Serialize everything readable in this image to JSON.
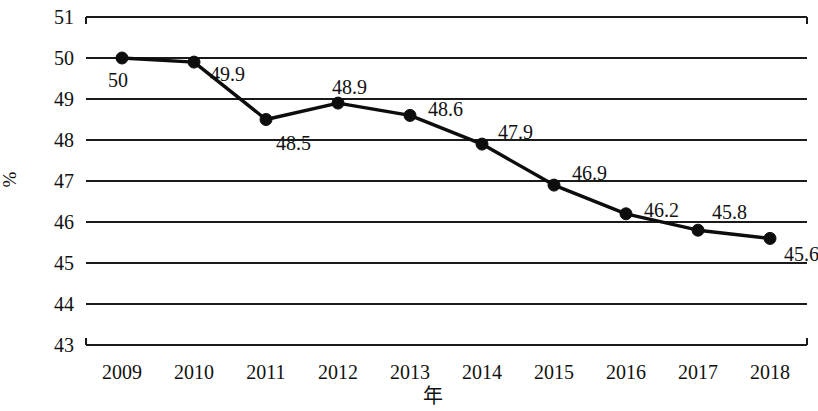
{
  "chart_data": {
    "type": "line",
    "title": "",
    "subtitle": "",
    "xlabel": "年",
    "ylabel": "%",
    "categories": [
      "2009",
      "2010",
      "2011",
      "2012",
      "2013",
      "2014",
      "2015",
      "2016",
      "2017",
      "2018"
    ],
    "values": [
      50,
      49.9,
      48.5,
      48.9,
      48.6,
      47.9,
      46.9,
      46.2,
      45.8,
      45.6
    ],
    "point_labels": [
      "50",
      "49.9",
      "48.5",
      "48.9",
      "48.6",
      "47.9",
      "46.9",
      "46.2",
      "45.8",
      "45.6"
    ],
    "ylim": [
      43,
      51
    ],
    "ytick_labels": [
      "51",
      "50",
      "49",
      "48",
      "47",
      "46",
      "45",
      "44",
      "43"
    ],
    "ytick_values": [
      51,
      50,
      49,
      48,
      47,
      46,
      45,
      44,
      43
    ],
    "grid": true,
    "grid_orientation": "horizontal",
    "legend": null,
    "legend_position": "none",
    "marker": "filled-circle",
    "line_color": "#0d0d0d",
    "grid_color": "#1a1a1a",
    "background_color": "#ffffff"
  },
  "axes": {
    "y_label_text": "%",
    "x_label_text": "年"
  }
}
